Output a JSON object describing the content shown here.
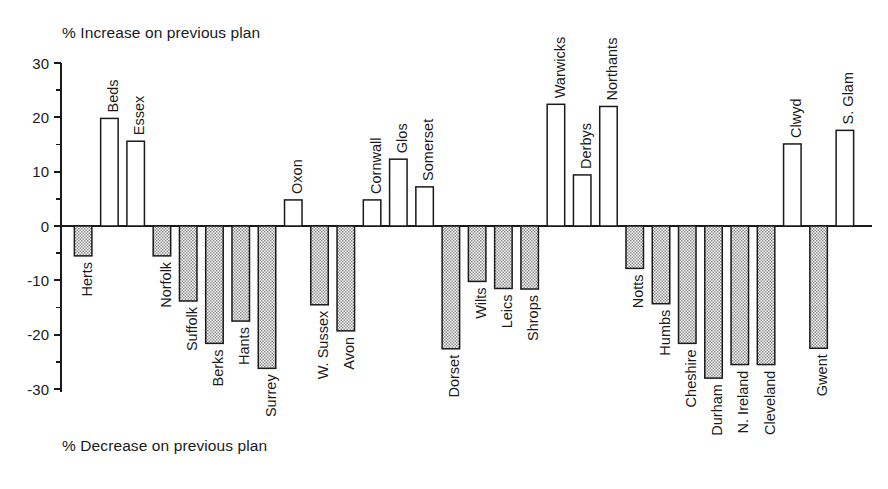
{
  "chart_data": {
    "type": "bar",
    "title": "",
    "top_label": "% Increase on previous plan",
    "bottom_label": "% Decrease on previous plan",
    "xlabel": "",
    "ylabel": "",
    "ylim": [
      -30,
      30
    ],
    "y_major_ticks": [
      30,
      20,
      10,
      0,
      -10,
      -20,
      -30
    ],
    "y_minor_ticks": [
      25,
      15,
      5,
      -5,
      -15,
      -25
    ],
    "y_tick_labels": [
      "30",
      "20",
      "10",
      "0",
      "-10",
      "-20",
      "-30"
    ],
    "grid": false,
    "legend": "none",
    "categories": [
      "Herts",
      "Beds",
      "Essex",
      "Norfolk",
      "Suffolk",
      "Berks",
      "Hants",
      "Surrey",
      "Oxon",
      "W. Sussex",
      "Avon",
      "Cornwall",
      "Glos",
      "Somerset",
      "Dorset",
      "Wilts",
      "Leics",
      "Shrops",
      "Warwicks",
      "Derbys",
      "Northants",
      "Notts",
      "Humbs",
      "Cheshire",
      "Durham",
      "N. Ireland",
      "Cleveland",
      "Clwyd",
      "Gwent",
      "S. Glam"
    ],
    "values": [
      -5.5,
      19.8,
      15.6,
      -5.5,
      -13.8,
      -21.6,
      -17.5,
      -26.2,
      4.8,
      -14.5,
      -19.3,
      4.8,
      12.3,
      7.2,
      -22.6,
      -10.2,
      -11.5,
      -11.6,
      22.4,
      9.4,
      22.0,
      -7.8,
      -14.3,
      -21.6,
      -28.0,
      -25.5,
      -25.5,
      15.1,
      -22.5,
      17.6
    ]
  }
}
